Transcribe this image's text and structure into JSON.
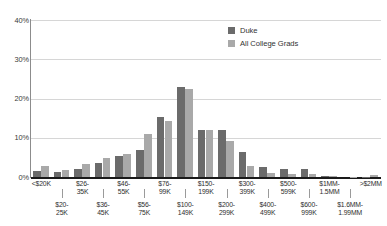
{
  "chart_data": {
    "type": "bar",
    "title": "",
    "subtitle": "",
    "xlabel": "",
    "ylabel": "",
    "ylim": [
      0,
      40
    ],
    "y_ticks": [
      "0%",
      "10%",
      "20%",
      "30%",
      "40%"
    ],
    "y_tick_values": [
      0,
      10,
      20,
      30,
      40
    ],
    "grid": true,
    "legend_position": "top-right",
    "categories": [
      "<$20K",
      "$20-25K",
      "$26-35K",
      "$36-45K",
      "$46-55K",
      "$56-75K",
      "$76-99K",
      "$100-149K",
      "$150-199K",
      "$200-299K",
      "$300-399K",
      "$400-499K",
      "$500-599K",
      "$600-999K",
      "$1MM-1.5MM",
      "$1.6MM-1.99MM",
      ">$2MM"
    ],
    "category_lines": [
      [
        "<$20K",
        ""
      ],
      [
        "$20-",
        "25K"
      ],
      [
        "$26-",
        "35K"
      ],
      [
        "$36-",
        "45K"
      ],
      [
        "$46-",
        "55K"
      ],
      [
        "$56-",
        "75K"
      ],
      [
        "$76-",
        "99K"
      ],
      [
        "$100-",
        "149K"
      ],
      [
        "$150-",
        "199K"
      ],
      [
        "$200-",
        "299K"
      ],
      [
        "$300-",
        "399K"
      ],
      [
        "$400-",
        "499K"
      ],
      [
        "$500-",
        "599K"
      ],
      [
        "$600-",
        "999K"
      ],
      [
        "$1MM-",
        "1.5MM"
      ],
      [
        "$1.6MM-",
        "1.99MM"
      ],
      [
        ">$2MM",
        ""
      ]
    ],
    "series": [
      {
        "name": "Duke",
        "color": "#6b6b6b",
        "values": [
          1.6,
          1.2,
          2.1,
          3.5,
          5.3,
          6.9,
          15.3,
          23.0,
          12.0,
          12.0,
          6.3,
          2.5,
          2.1,
          2.1,
          0.2,
          0.0,
          0.1
        ]
      },
      {
        "name": "All College Grads",
        "color": "#a9a9a9",
        "values": [
          2.8,
          1.7,
          3.4,
          4.8,
          5.8,
          11.0,
          14.3,
          22.5,
          12.0,
          9.2,
          2.7,
          1.1,
          0.7,
          0.7,
          0.3,
          0.1,
          0.6
        ]
      }
    ]
  },
  "legend": {
    "items": [
      {
        "label": "Duke",
        "color": "#6b6b6b"
      },
      {
        "label": "All College Grads",
        "color": "#a9a9a9"
      }
    ]
  },
  "colors": {
    "duke": "#6b6b6b",
    "grads": "#a9a9a9",
    "gridline": "#d6d6d6",
    "axis": "#1a1a1a",
    "background": "#ffffff",
    "text": "#2b2b2b"
  }
}
